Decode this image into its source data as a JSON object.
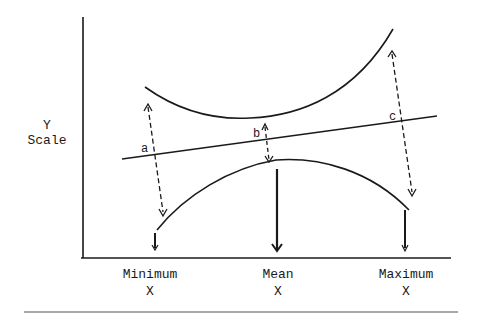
{
  "figure": {
    "y_axis_label": [
      "Y",
      "Scale"
    ],
    "x_ticks": [
      {
        "line1": "Minimum",
        "line2": "X"
      },
      {
        "line1": "Mean",
        "line2": "X"
      },
      {
        "line1": "Maximum",
        "line2": "X"
      }
    ],
    "points": [
      "a",
      "b",
      "c"
    ],
    "elements": {
      "regression_line": "straight line rising left to right",
      "upper_band": "curved upper confidence band, narrowest at mean X",
      "lower_band": "curved lower confidence band, closest at mean X",
      "dashed_arrows": "double-headed dashed arrows at a, b, c showing band width",
      "solid_arrows": "downward arrows to Minimum X, Mean X, Maximum X"
    },
    "colors": {
      "ink": "#1a1a1a",
      "rule": "#555555"
    }
  }
}
